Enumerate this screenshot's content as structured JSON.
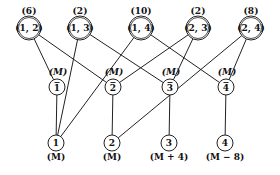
{
  "diagram": {
    "type": "layered-graph",
    "top_nodes": [
      {
        "id": "t12",
        "label": "(1, 2)",
        "weight": "(6)",
        "x": 29,
        "y": 28
      },
      {
        "id": "t13",
        "label": "(1, 3)",
        "weight": "(2)",
        "x": 80,
        "y": 28
      },
      {
        "id": "t14",
        "label": "(1, 4)",
        "weight": "(10)",
        "x": 141,
        "y": 28
      },
      {
        "id": "t23",
        "label": "(2, 3)",
        "weight": "(2)",
        "x": 198,
        "y": 28
      },
      {
        "id": "t24",
        "label": "(2, 4)",
        "weight": "(8)",
        "x": 251,
        "y": 28
      }
    ],
    "middle_nodes": [
      {
        "id": "m1",
        "label": "1",
        "bar": true,
        "annotation": "(M)",
        "x": 57,
        "y": 87
      },
      {
        "id": "m2",
        "label": "2",
        "bar": true,
        "annotation": "(M)",
        "x": 113,
        "y": 87
      },
      {
        "id": "m3",
        "label": "3",
        "bar": true,
        "annotation": "(M)",
        "x": 170,
        "y": 87
      },
      {
        "id": "m4",
        "label": "4",
        "bar": true,
        "annotation": "(M)",
        "x": 226,
        "y": 87
      }
    ],
    "bottom_nodes": [
      {
        "id": "b1",
        "label": "1",
        "annotation": "(M)",
        "x": 56,
        "y": 143
      },
      {
        "id": "b2",
        "label": "2",
        "annotation": "(M)",
        "x": 112,
        "y": 143
      },
      {
        "id": "b3",
        "label": "3",
        "annotation": "(M + 4)",
        "x": 169,
        "y": 143
      },
      {
        "id": "b4",
        "label": "4",
        "annotation": "(M − 8)",
        "x": 225,
        "y": 143
      }
    ],
    "edges": [
      [
        "t12",
        "m1"
      ],
      [
        "t12",
        "m2"
      ],
      [
        "t13",
        "b1"
      ],
      [
        "t13",
        "m3"
      ],
      [
        "t14",
        "b1"
      ],
      [
        "t14",
        "m4"
      ],
      [
        "t23",
        "m2"
      ],
      [
        "t23",
        "m3"
      ],
      [
        "t24",
        "b2"
      ],
      [
        "t24",
        "m4"
      ],
      [
        "m1",
        "b1"
      ],
      [
        "m2",
        "b2"
      ],
      [
        "m3",
        "b3"
      ],
      [
        "m4",
        "b4"
      ]
    ]
  }
}
